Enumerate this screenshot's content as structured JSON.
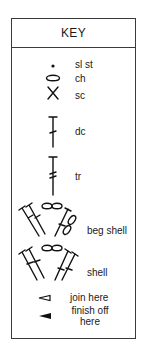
{
  "key": {
    "title": "KEY",
    "items": [
      {
        "symbol": "dot-icon",
        "label": "sl st"
      },
      {
        "symbol": "oval-icon",
        "label": "ch"
      },
      {
        "symbol": "x-icon",
        "label": "sc"
      },
      {
        "symbol": "dc-icon",
        "label": "dc"
      },
      {
        "symbol": "tr-icon",
        "label": "tr"
      },
      {
        "symbol": "beg-shell-icon",
        "label": "beg shell"
      },
      {
        "symbol": "shell-icon",
        "label": "shell"
      },
      {
        "symbol": "open-triangle-icon",
        "label": "join here"
      },
      {
        "symbol": "filled-triangle-icon",
        "label": "finish off here",
        "label_lines": [
          "finish off",
          "here"
        ]
      }
    ]
  }
}
